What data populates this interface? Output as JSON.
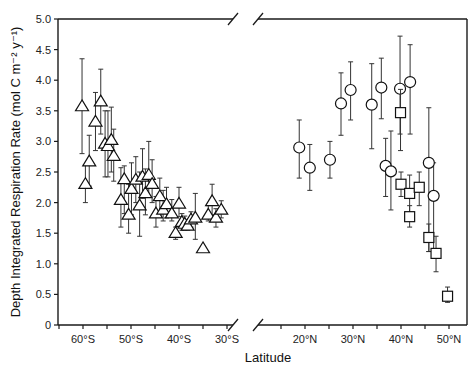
{
  "chart_data": {
    "type": "scatter",
    "title": "",
    "xlabel": "Latitude",
    "ylabel": "Depth Integrated Respiration Rate (mol C m⁻² y⁻¹)",
    "ylim": [
      0,
      5.0
    ],
    "yticks": [
      "0",
      "0.5",
      "1.0",
      "1.5",
      "2.0",
      "2.5",
      "3.0",
      "3.5",
      "4.0",
      "4.5",
      "5.0"
    ],
    "ytick_values": [
      0,
      0.5,
      1.0,
      1.5,
      2.0,
      2.5,
      3.0,
      3.5,
      4.0,
      4.5,
      5.0
    ],
    "x_broken_axis": true,
    "x_segments": [
      {
        "hemisphere": "S",
        "range": [
          64.5,
          25.5
        ],
        "ticks": [
          60,
          50,
          40,
          30
        ],
        "tick_labels": [
          "60°S",
          "50°S",
          "40°S",
          "30°S"
        ]
      },
      {
        "hemisphere": "N",
        "range": [
          14.5,
          53.5
        ],
        "ticks": [
          20,
          30,
          40,
          50
        ],
        "tick_labels": [
          "20°N",
          "30°N",
          "40°N",
          "50°N"
        ]
      }
    ],
    "grid": false,
    "series": [
      {
        "name": "Southern Hemisphere (triangles)",
        "marker": "triangle",
        "hemisphere": "S",
        "points": [
          {
            "lat": 60.2,
            "y": 3.57,
            "lo": 2.8,
            "hi": 4.35
          },
          {
            "lat": 59.5,
            "y": 2.3,
            "lo": 2.0,
            "hi": 2.62
          },
          {
            "lat": 58.7,
            "y": 2.67,
            "lo": 2.27,
            "hi": 3.1
          },
          {
            "lat": 57.4,
            "y": 3.32,
            "lo": 2.85,
            "hi": 3.8
          },
          {
            "lat": 56.3,
            "y": 3.65,
            "lo": 3.12,
            "hi": 4.18
          },
          {
            "lat": 55.4,
            "y": 2.96,
            "lo": 2.42,
            "hi": 3.5
          },
          {
            "lat": 54.8,
            "y": 2.92,
            "lo": 2.42,
            "hi": 3.5
          },
          {
            "lat": 54.1,
            "y": 3.02,
            "lo": 2.5,
            "hi": 3.56
          },
          {
            "lat": 53.6,
            "y": 2.76,
            "lo": 2.35,
            "hi": 3.2
          },
          {
            "lat": 52.1,
            "y": 2.04,
            "lo": 1.6,
            "hi": 2.57
          },
          {
            "lat": 51.4,
            "y": 2.38,
            "lo": 1.82,
            "hi": 2.6
          },
          {
            "lat": 50.5,
            "y": 1.8,
            "lo": 1.5,
            "hi": 2.3
          },
          {
            "lat": 49.9,
            "y": 2.22,
            "lo": 1.8,
            "hi": 2.65
          },
          {
            "lat": 49.0,
            "y": 2.37,
            "lo": 2.0,
            "hi": 2.75
          },
          {
            "lat": 48.2,
            "y": 1.95,
            "lo": 1.45,
            "hi": 2.5
          },
          {
            "lat": 47.6,
            "y": 2.42,
            "lo": 2.07,
            "hi": 2.88
          },
          {
            "lat": 47.0,
            "y": 2.15,
            "lo": 1.8,
            "hi": 2.55
          },
          {
            "lat": 46.3,
            "y": 2.45,
            "lo": 2.1,
            "hi": 3.0
          },
          {
            "lat": 45.6,
            "y": 2.3,
            "lo": 2.0,
            "hi": 2.7
          },
          {
            "lat": 44.8,
            "y": 1.82,
            "lo": 1.6,
            "hi": 2.1
          },
          {
            "lat": 44.0,
            "y": 2.1,
            "lo": 1.8,
            "hi": 2.4
          },
          {
            "lat": 43.3,
            "y": 1.88,
            "lo": 1.7,
            "hi": 2.2
          },
          {
            "lat": 42.6,
            "y": 1.97,
            "lo": 1.75,
            "hi": 2.25
          },
          {
            "lat": 41.5,
            "y": 1.82,
            "lo": 1.7,
            "hi": 2.05
          },
          {
            "lat": 40.7,
            "y": 1.5,
            "lo": 1.4,
            "hi": 1.6
          },
          {
            "lat": 40.0,
            "y": 1.98,
            "lo": 1.77,
            "hi": 2.25
          },
          {
            "lat": 39.4,
            "y": 1.68,
            "lo": 1.55,
            "hi": 1.82
          },
          {
            "lat": 38.8,
            "y": 1.65,
            "lo": 1.55,
            "hi": 1.78
          },
          {
            "lat": 38.2,
            "y": 1.62,
            "lo": 1.55,
            "hi": 1.72
          },
          {
            "lat": 37.5,
            "y": 1.72,
            "lo": 1.6,
            "hi": 1.85
          },
          {
            "lat": 36.6,
            "y": 1.75,
            "lo": 1.4,
            "hi": 2.15
          },
          {
            "lat": 35.0,
            "y": 1.25,
            "lo": 1.25,
            "hi": 1.25
          },
          {
            "lat": 33.9,
            "y": 1.8,
            "lo": 1.7,
            "hi": 1.95
          },
          {
            "lat": 33.1,
            "y": 2.02,
            "lo": 1.8,
            "hi": 2.3
          },
          {
            "lat": 32.3,
            "y": 1.75,
            "lo": 1.6,
            "hi": 1.9
          },
          {
            "lat": 31.2,
            "y": 1.88,
            "lo": 1.75,
            "hi": 2.03
          }
        ]
      },
      {
        "name": "Northern Hemisphere (circles)",
        "marker": "circle",
        "hemisphere": "N",
        "points": [
          {
            "lat": 18.8,
            "y": 2.9,
            "lo": 2.4,
            "hi": 3.35
          },
          {
            "lat": 21.0,
            "y": 2.57,
            "lo": 2.2,
            "hi": 2.95
          },
          {
            "lat": 25.2,
            "y": 2.7,
            "lo": 2.4,
            "hi": 3.0
          },
          {
            "lat": 27.5,
            "y": 3.62,
            "lo": 3.1,
            "hi": 4.12
          },
          {
            "lat": 29.5,
            "y": 3.84,
            "lo": 3.35,
            "hi": 4.3
          },
          {
            "lat": 33.9,
            "y": 3.6,
            "lo": 2.88,
            "hi": 4.27
          },
          {
            "lat": 35.9,
            "y": 3.88,
            "lo": 3.37,
            "hi": 4.36
          },
          {
            "lat": 36.8,
            "y": 2.6,
            "lo": 2.1,
            "hi": 3.05
          },
          {
            "lat": 37.9,
            "y": 2.51,
            "lo": 1.88,
            "hi": 3.17
          },
          {
            "lat": 39.8,
            "y": 3.86,
            "lo": 3.12,
            "hi": 4.72
          },
          {
            "lat": 41.9,
            "y": 3.97,
            "lo": 3.12,
            "hi": 4.58
          },
          {
            "lat": 45.8,
            "y": 2.65,
            "lo": 1.2,
            "hi": 3.55
          },
          {
            "lat": 46.8,
            "y": 2.11,
            "lo": 1.1,
            "hi": 2.65
          }
        ]
      },
      {
        "name": "Northern Hemisphere (squares)",
        "marker": "square",
        "hemisphere": "N",
        "points": [
          {
            "lat": 39.9,
            "y": 3.47,
            "lo": 2.85,
            "hi": 3.85
          },
          {
            "lat": 40.0,
            "y": 2.3,
            "lo": 2.1,
            "hi": 2.5
          },
          {
            "lat": 41.8,
            "y": 2.15,
            "lo": 1.8,
            "hi": 2.45
          },
          {
            "lat": 41.8,
            "y": 1.77,
            "lo": 1.6,
            "hi": 1.95
          },
          {
            "lat": 43.8,
            "y": 2.25,
            "lo": 1.95,
            "hi": 2.5
          },
          {
            "lat": 45.8,
            "y": 1.43,
            "lo": 1.2,
            "hi": 1.65
          },
          {
            "lat": 47.3,
            "y": 1.17,
            "lo": 0.87,
            "hi": 1.45
          },
          {
            "lat": 49.7,
            "y": 0.47,
            "lo": 0.37,
            "hi": 0.62
          }
        ]
      }
    ]
  }
}
